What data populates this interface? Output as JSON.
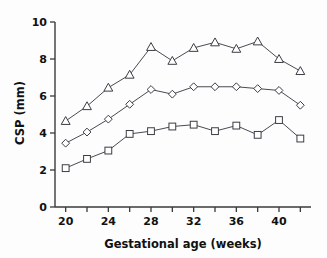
{
  "chart_data": {
    "type": "line",
    "title": "",
    "xlabel": "Gestational age (weeks)",
    "ylabel": "CSP (mm)",
    "xlim": [
      19,
      43
    ],
    "ylim": [
      0,
      10
    ],
    "grid": false,
    "legend_position": "none",
    "x": [
      20,
      22,
      24,
      26,
      28,
      30,
      32,
      34,
      36,
      38,
      40,
      42
    ],
    "xticks": [
      20,
      24,
      28,
      32,
      36,
      40
    ],
    "xtick_labels": [
      "20",
      "24",
      "28",
      "32",
      "36",
      "40"
    ],
    "xminor_ticks": [
      22,
      26,
      30,
      34,
      38,
      42
    ],
    "yticks": [
      0,
      2,
      4,
      6,
      8,
      10
    ],
    "ytick_labels": [
      "0",
      "2",
      "4",
      "6",
      "8",
      "10"
    ],
    "series": [
      {
        "name": "upper-percentile",
        "marker": "triangle",
        "values": [
          4.65,
          5.45,
          6.45,
          7.15,
          8.65,
          7.9,
          8.6,
          8.9,
          8.55,
          8.95,
          8.0,
          7.35
        ]
      },
      {
        "name": "median",
        "marker": "diamond",
        "values": [
          3.45,
          4.05,
          4.75,
          5.55,
          6.35,
          6.1,
          6.5,
          6.5,
          6.5,
          6.4,
          6.3,
          5.5
        ]
      },
      {
        "name": "lower-percentile",
        "marker": "square",
        "values": [
          2.1,
          2.6,
          3.05,
          3.95,
          4.1,
          4.35,
          4.45,
          4.1,
          4.4,
          3.9,
          4.7,
          3.7
        ]
      }
    ]
  }
}
